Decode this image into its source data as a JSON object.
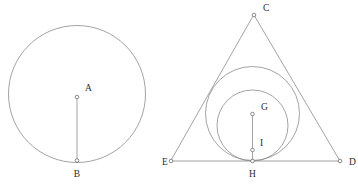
{
  "figure": {
    "canvas": {
      "width": 358,
      "height": 186,
      "background": "#ffffff"
    },
    "stroke_color": "#8c8c8c",
    "label_color": "#2b2b2b",
    "vertex_fill": "#ffffff"
  },
  "left_figure": {
    "name": "circle-with-radius",
    "circle": {
      "cx": 77,
      "cy": 94,
      "r": 68.5
    },
    "segment": {
      "x1": 77,
      "y1": 97,
      "x2": 77,
      "y2": 160.5
    },
    "points": [
      {
        "id": "A",
        "label": "A",
        "cx": 77,
        "cy": 97,
        "r": 1.8,
        "label_x": 85,
        "label_y": 91
      },
      {
        "id": "B",
        "label": "B",
        "cx": 77,
        "cy": 160.5,
        "r": 1.8,
        "label_x": 77,
        "label_y": 177
      }
    ]
  },
  "right_figure": {
    "name": "triangle-with-two-inscribed-circles",
    "triangle": {
      "vertices": [
        {
          "id": "C",
          "x": 254,
          "y": 15
        },
        {
          "id": "D",
          "x": 340,
          "y": 161
        },
        {
          "id": "E",
          "x": 171,
          "y": 161
        }
      ],
      "path": "M 254 15 L 340 161 L 171 161 Z"
    },
    "circles": [
      {
        "id": "outer-circle",
        "cx": 252.5,
        "cy": 113.5,
        "r": 47
      },
      {
        "id": "inner-circle",
        "cx": 252.5,
        "cy": 125.5,
        "r": 35.5
      }
    ],
    "segment": {
      "x1": 252.5,
      "y1": 114,
      "x2": 252.5,
      "y2": 161
    },
    "points": [
      {
        "id": "C",
        "label": "C",
        "cx": 254,
        "cy": 15,
        "r": 1.8,
        "label_x": 263,
        "label_y": 11
      },
      {
        "id": "D",
        "label": "D",
        "cx": 340,
        "cy": 161,
        "r": 1.8,
        "label_x": 349,
        "label_y": 165
      },
      {
        "id": "E",
        "label": "E",
        "cx": 171,
        "cy": 161,
        "r": 1.8,
        "label_x": 162,
        "label_y": 165
      },
      {
        "id": "G",
        "label": "G",
        "cx": 252.5,
        "cy": 114,
        "r": 1.8,
        "label_x": 261,
        "label_y": 110
      },
      {
        "id": "I",
        "label": "I",
        "cx": 252.5,
        "cy": 150,
        "r": 1.8,
        "label_x": 260,
        "label_y": 146
      },
      {
        "id": "H",
        "label": "H",
        "cx": 252.5,
        "cy": 161,
        "r": 1.8,
        "label_x": 252.5,
        "label_y": 177
      }
    ]
  }
}
